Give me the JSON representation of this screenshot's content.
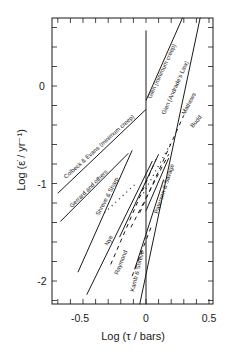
{
  "chart_data": {
    "type": "line",
    "title": "",
    "xlabel": "Log  (τ / bars)",
    "ylabel": "Log  (ε̇ / yr⁻¹)",
    "xlim": [
      -0.72,
      0.53
    ],
    "ylim": [
      -2.24,
      0.7
    ],
    "x_ticks": [
      -0.5,
      0,
      0.5
    ],
    "x_tick_labels": [
      "-0.5",
      "0",
      "0.5"
    ],
    "y_ticks": [
      0,
      -1,
      -2
    ],
    "y_tick_labels": [
      "0",
      "-1",
      "-2"
    ],
    "grid": false,
    "legend": "none (inline labels)",
    "reference_line": {
      "x": 0,
      "y_from": -2.24,
      "y_to": 0.57
    },
    "series": [
      {
        "name": "Glen (minimum creep)",
        "style": "solid",
        "x": [
          0.0,
          0.29
        ],
        "y": [
          -0.15,
          0.7
        ]
      },
      {
        "name": "Colbeck & Evans (minimum creep)",
        "style": "solid",
        "x": [
          -0.7,
          0.0
        ],
        "y": [
          -1.1,
          -0.24
        ]
      },
      {
        "name": "Glen (Andrade's Law)",
        "style": "solid",
        "x": [
          -0.05,
          0.43
        ],
        "y": [
          -2.24,
          0.7
        ]
      },
      {
        "name": "Mathews",
        "style": "dashed",
        "x": [
          -0.05,
          0.3
        ],
        "y": [
          -1.3,
          -0.3
        ]
      },
      {
        "name": "Budd",
        "style": "dotted",
        "x": [
          -0.02,
          0.2
        ],
        "y": [
          -1.1,
          -0.58
        ]
      },
      {
        "name": "Gerrard and others",
        "style": "solid",
        "x": [
          -0.68,
          -0.14
        ],
        "y": [
          -1.39,
          -0.69
        ]
      },
      {
        "name": "Shreve & Sharp",
        "style": "solid",
        "x": [
          -0.54,
          -0.11
        ],
        "y": [
          -1.91,
          -0.66
        ]
      },
      {
        "name": "Shreve & Sharp (dotted)",
        "style": "dotted",
        "x": [
          -0.33,
          -0.08
        ],
        "y": [
          -1.3,
          -1.0
        ]
      },
      {
        "name": "Nye",
        "style": "solid",
        "x": [
          -0.47,
          0.05
        ],
        "y": [
          -2.14,
          -0.77
        ]
      },
      {
        "name": "Nye (dashed)",
        "style": "dashed",
        "x": [
          -0.28,
          0.08
        ],
        "y": [
          -1.83,
          -0.75
        ]
      },
      {
        "name": "Raymond",
        "style": "solid",
        "x": [
          -0.21,
          0.1
        ],
        "y": [
          -1.55,
          -0.7
        ]
      },
      {
        "name": "Raymond (dashed)",
        "style": "dashed",
        "x": [
          -0.12,
          0.18
        ],
        "y": [
          -1.45,
          -0.7
        ]
      },
      {
        "name": "Kamb & Shreve",
        "style": "solid",
        "x": [
          -0.09,
          0.14
        ],
        "y": [
          -1.88,
          -0.96
        ]
      },
      {
        "name": "Kamb & Shreve (dashed)",
        "style": "dashed",
        "x": [
          -0.11,
          0.04
        ],
        "y": [
          -1.95,
          -1.45
        ]
      },
      {
        "name": "Paterson & Savage",
        "style": "solid",
        "x": [
          0.0,
          0.18
        ],
        "y": [
          -1.28,
          -0.74
        ]
      }
    ]
  },
  "labels": {
    "glen_min": "Glen (minimum creep)",
    "colbeck": "Colbeck & Evans (minimum creep)",
    "glen_andrade": "Glen (Andrade's Law)",
    "mathews": "Mathews",
    "budd": "Budd",
    "gerrard": "Gerrard and others",
    "shreve": "Shreve & Sharp",
    "nye": "Nye",
    "raymond": "Raymond",
    "kamb": "Kamb & Shreve",
    "paterson": "Paterson & Savage"
  },
  "axes": {
    "x_title": "Log  (τ / bars)",
    "y_title": "Log  (ε̇ / yr⁻¹)",
    "x_tick_labels": [
      "-0.5",
      "0",
      "0.5"
    ],
    "y_tick_labels": [
      "0",
      "-1",
      "-2"
    ]
  }
}
